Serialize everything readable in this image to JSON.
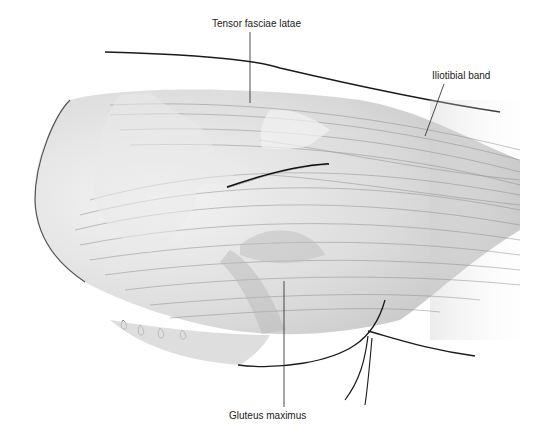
{
  "figure": {
    "type": "anatomical-illustration",
    "style": "grayscale pencil drawing",
    "labels": {
      "tensor": "Tensor fasciae latae",
      "itband": "Iliotibial band",
      "gluteus": "Gluteus maximus"
    },
    "colors": {
      "background": "#ffffff",
      "outline": "#1a1a1a",
      "muscle_fill": "#d9d9d9",
      "fiber": "#8a8a8a"
    }
  }
}
